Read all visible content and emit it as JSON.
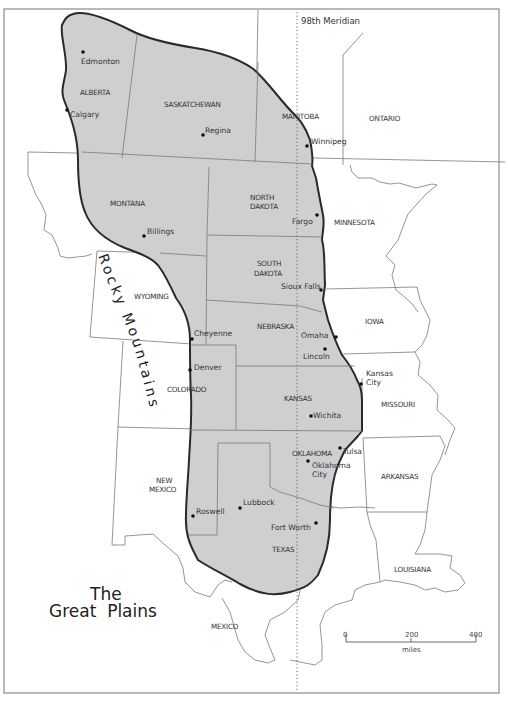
{
  "map": {
    "title_line1": "The",
    "title_line2": "Great  Plains",
    "meridian_label": "98th  Meridian",
    "mountain_label": "Rocky Mountains",
    "colors": {
      "plains_fill": "#cfcfcf",
      "plains_outline": "#2a2a2a",
      "background": "#ffffff",
      "border": "#7a7a7a"
    },
    "regions": [
      {
        "name": "ALBERTA"
      },
      {
        "name": "SASKATCHEWAN"
      },
      {
        "name": "MANITOBA"
      },
      {
        "name": "ONTARIO"
      },
      {
        "name": "MONTANA"
      },
      {
        "name": "NORTH"
      },
      {
        "name": "DAKOTA"
      },
      {
        "name": "MINNESOTA"
      },
      {
        "name": "WYOMING"
      },
      {
        "name": "SOUTH"
      },
      {
        "name": "DAKOTA"
      },
      {
        "name": "NEBRASKA"
      },
      {
        "name": "IOWA"
      },
      {
        "name": "COLORADO"
      },
      {
        "name": "KANSAS"
      },
      {
        "name": "MISSOURI"
      },
      {
        "name": "OKLAHOMA"
      },
      {
        "name": "ARKANSAS"
      },
      {
        "name": "NEW"
      },
      {
        "name": "MEXICO"
      },
      {
        "name": "TEXAS"
      },
      {
        "name": "LOUISIANA"
      },
      {
        "name": "MEXICO"
      }
    ],
    "cities": [
      {
        "name": "Edmonton"
      },
      {
        "name": "Calgary"
      },
      {
        "name": "Regina"
      },
      {
        "name": "Winnipeg"
      },
      {
        "name": "Fargo"
      },
      {
        "name": "Billings"
      },
      {
        "name": "Sioux Falls"
      },
      {
        "name": "Cheyenne"
      },
      {
        "name": "Omaha"
      },
      {
        "name": "Lincoln"
      },
      {
        "name": "Denver"
      },
      {
        "name": "Kansas"
      },
      {
        "name": "City"
      },
      {
        "name": "Wichita"
      },
      {
        "name": "Tulsa"
      },
      {
        "name": "Oklahoma"
      },
      {
        "name": "City"
      },
      {
        "name": "Lubbock"
      },
      {
        "name": "Roswell"
      },
      {
        "name": "Fort Worth"
      }
    ],
    "scale_bar": {
      "ticks": [
        "0",
        "200",
        "400"
      ],
      "unit": "miles"
    }
  }
}
